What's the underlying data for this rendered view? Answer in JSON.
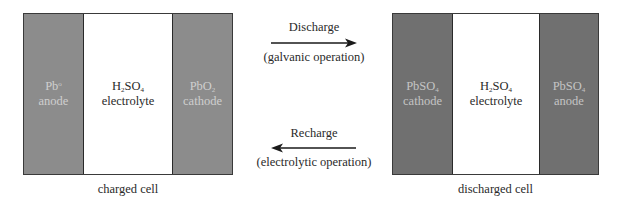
{
  "charged_cell": {
    "caption": "charged cell",
    "regions": [
      {
        "formula_main": "Pb",
        "formula_sub": "",
        "formula_sup": "o",
        "formula_tail": "",
        "role": "anode"
      },
      {
        "formula_main": "H",
        "formula_sub": "2",
        "formula_sup": "",
        "formula_tail": "SO",
        "formula_tail_sub": "4",
        "role": "electrolyte"
      },
      {
        "formula_main": "PbO",
        "formula_sub": "2",
        "formula_sup": "",
        "formula_tail": "",
        "role": "cathode"
      }
    ]
  },
  "discharged_cell": {
    "caption": "discharged cell",
    "regions": [
      {
        "formula_main": "PbSO",
        "formula_sub": "4",
        "formula_sup": "",
        "formula_tail": "",
        "role": "cathode"
      },
      {
        "formula_main": "H",
        "formula_sub": "2",
        "formula_sup": "",
        "formula_tail": "SO",
        "formula_tail_sub": "4",
        "role": "electrolyte"
      },
      {
        "formula_main": "PbSO",
        "formula_sub": "4",
        "formula_sup": "",
        "formula_tail": "",
        "role": "anode"
      }
    ]
  },
  "processes": {
    "discharge": {
      "label": "Discharge",
      "sublabel": "(galvanic operation)",
      "direction": "right"
    },
    "recharge": {
      "label": "Recharge",
      "sublabel": "(electrolytic operation)",
      "direction": "left"
    }
  },
  "colors": {
    "charged_electrode": "#8c8c8c",
    "discharged_electrode": "#707070",
    "electrolyte": "#ffffff",
    "border": "#2a2a2a"
  }
}
